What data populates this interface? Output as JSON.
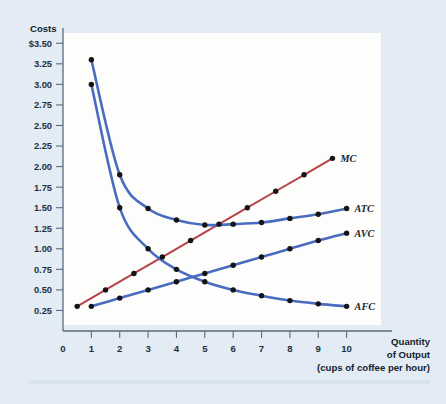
{
  "figure": {
    "background_color": "#e3ecf4",
    "plot_background_color": "#fdfdfb",
    "y_axis_title": "Costs",
    "x_axis_title_line1": "Quantity",
    "x_axis_title_line2": "of Output",
    "x_axis_title_line3": "(cups of coffee per hour)"
  },
  "chart_data": {
    "type": "line",
    "title": "",
    "subtitle": "",
    "xlabel": "Quantity of Output (cups of coffee per hour)",
    "ylabel": "Costs",
    "xlim": [
      0,
      11.6
    ],
    "ylim": [
      0,
      3.625
    ],
    "grid": false,
    "legend_position": "right-of-curve-ends",
    "x_ticks": [
      0,
      1,
      2,
      3,
      4,
      5,
      6,
      7,
      8,
      9,
      10
    ],
    "x_tick_labels": [
      "0",
      "1",
      "2",
      "3",
      "4",
      "5",
      "6",
      "7",
      "8",
      "9",
      "10"
    ],
    "y_ticks": [
      0.25,
      0.5,
      0.75,
      1.0,
      1.25,
      1.5,
      1.75,
      2.0,
      2.25,
      2.5,
      2.75,
      3.0,
      3.25,
      3.5
    ],
    "y_tick_labels": [
      "0.25",
      "0.50",
      "0.75",
      "1.00",
      "1.25",
      "1.50",
      "1.75",
      "2.00",
      "2.25",
      "2.50",
      "2.75",
      "3.00",
      "3.25",
      "$3.50"
    ],
    "series": [
      {
        "name": "MC",
        "label": "MC",
        "color": "#b5434b",
        "x": [
          0.5,
          1.5,
          2.5,
          3.5,
          4.5,
          5.5,
          6.5,
          7.5,
          8.5,
          9.5
        ],
        "values": [
          0.3,
          0.5,
          0.7,
          0.9,
          1.1,
          1.3,
          1.5,
          1.7,
          1.9,
          2.1
        ]
      },
      {
        "name": "ATC",
        "label": "ATC",
        "color": "#4a6cc0",
        "x": [
          1,
          2,
          3,
          4,
          5,
          6,
          7,
          8,
          9,
          10
        ],
        "values": [
          3.3,
          1.9,
          1.49,
          1.35,
          1.29,
          1.3,
          1.32,
          1.37,
          1.42,
          1.49
        ]
      },
      {
        "name": "AVC",
        "label": "AVC",
        "color": "#4a6cc0",
        "x": [
          1,
          2,
          3,
          4,
          5,
          6,
          7,
          8,
          9,
          10
        ],
        "values": [
          0.3,
          0.4,
          0.5,
          0.6,
          0.7,
          0.8,
          0.9,
          1.0,
          1.1,
          1.19
        ]
      },
      {
        "name": "AFC",
        "label": "AFC",
        "color": "#4a6cc0",
        "x": [
          1,
          2,
          3,
          4,
          5,
          6,
          7,
          8,
          9,
          10
        ],
        "values": [
          3.0,
          1.5,
          1.0,
          0.75,
          0.6,
          0.5,
          0.43,
          0.37,
          0.33,
          0.3
        ]
      }
    ]
  }
}
